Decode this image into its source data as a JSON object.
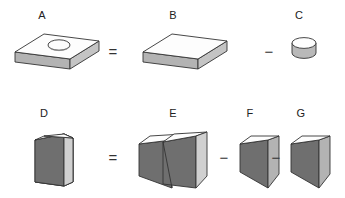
{
  "figure": {
    "background_color": "#ffffff",
    "palette": {
      "outline": "#333333",
      "face_top_white": "#fdfdfd",
      "face_light": "#d0d0d0",
      "face_medium": "#b3b3b3",
      "face_dark": "#6f6f6f",
      "label_color": "#222222",
      "operator_color": "#333333"
    },
    "rows": [
      {
        "name": "row-slab",
        "equation_text": "A = B - C",
        "items": [
          {
            "key": "A",
            "label": "A",
            "shape": "slab-with-hole",
            "description": "rectangular slab with circular hole in top face"
          },
          {
            "key": "op1",
            "label": "=",
            "shape": "operator",
            "description": "equals sign"
          },
          {
            "key": "B",
            "label": "B",
            "shape": "slab",
            "description": "solid rectangular slab"
          },
          {
            "key": "op2",
            "label": "−",
            "shape": "operator",
            "description": "minus sign"
          },
          {
            "key": "C",
            "label": "C",
            "shape": "cylinder",
            "description": "short circular cylinder"
          }
        ]
      },
      {
        "name": "row-prism",
        "equation_text": "D = E - F - G",
        "items": [
          {
            "key": "D",
            "label": "D",
            "shape": "wedge",
            "description": "single wedge / oblique triangular prism"
          },
          {
            "key": "op3",
            "label": "=",
            "shape": "operator",
            "description": "equals sign"
          },
          {
            "key": "E",
            "label": "E",
            "shape": "double-prism",
            "description": "box split into two triangular prisms"
          },
          {
            "key": "op4",
            "label": "−",
            "shape": "operator",
            "description": "minus sign"
          },
          {
            "key": "F",
            "label": "F",
            "shape": "prism",
            "description": "triangular prism"
          },
          {
            "key": "op5",
            "label": "−",
            "shape": "operator",
            "description": "minus sign"
          },
          {
            "key": "G",
            "label": "G",
            "shape": "prism",
            "description": "triangular prism"
          }
        ]
      }
    ],
    "labels": {
      "a": "A",
      "b": "B",
      "c": "C",
      "d": "D",
      "e": "E",
      "f": "F",
      "g": "G"
    },
    "operators": {
      "equals_row1": "=",
      "minus_row1": "−",
      "equals_row2": "=",
      "minus_row2_first": "−",
      "minus_row2_second": "−"
    }
  }
}
